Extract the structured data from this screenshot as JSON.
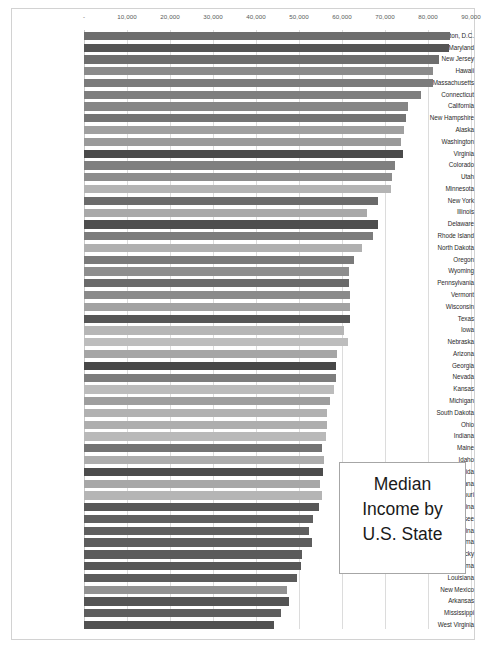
{
  "title_box": {
    "text": "Median\nIncome by\nU.S. State"
  },
  "chart_data": {
    "type": "bar",
    "orientation": "horizontal",
    "title": "Median Income by U.S. State",
    "xlabel": "",
    "ylabel": "",
    "xlim": [
      0,
      90000
    ],
    "grid": true,
    "legend": "none",
    "tick_labels": [
      "-",
      "10,000",
      "20,000",
      "30,000",
      "40,000",
      "50,000",
      "60,000",
      "70,000",
      "80,000",
      "90,000"
    ],
    "tick_values": [
      0,
      10000,
      20000,
      30000,
      40000,
      50000,
      60000,
      70000,
      80000,
      90000
    ],
    "categories": [
      "Washington, D.C.",
      "Maryland",
      "New Jersey",
      "Hawaii",
      "Massachusetts",
      "Connecticut",
      "California",
      "New Hampshire",
      "Alaska",
      "Washington",
      "Virginia",
      "Colorado",
      "Utah",
      "Minnesota",
      "New York",
      "Illinois",
      "Delaware",
      "Rhode Island",
      "North Dakota",
      "Oregon",
      "Wyoming",
      "Pennsylvania",
      "Vermont",
      "Wisconsin",
      "Texas",
      "Iowa",
      "Nebraska",
      "Arizona",
      "Georgia",
      "Nevada",
      "Kansas",
      "Michigan",
      "South Dakota",
      "Ohio",
      "Indiana",
      "Maine",
      "Idaho",
      "Florida",
      "Montana",
      "Missouri",
      "North Carolina",
      "Tennessee",
      "South Carolina",
      "Oklahoma",
      "Kentucky",
      "Alabama",
      "Louisiana",
      "New Mexico",
      "Arkansas",
      "Mississippi",
      "West Virginia"
    ],
    "values": [
      85203,
      84805,
      82545,
      81275,
      81215,
      78444,
      75235,
      74991,
      74346,
      73775,
      74222,
      72331,
      71621,
      71306,
      68486,
      65886,
      68287,
      67167,
      64577,
      62818,
      61584,
      61744,
      61973,
      61747,
      61874,
      60523,
      61439,
      58945,
      58700,
      58646,
      58218,
      57144,
      56521,
      56602,
      56303,
      55425,
      55785,
      55660,
      54970,
      55461,
      54602,
      53320,
      52306,
      52919,
      50589,
      50536,
      49469,
      47169,
      47597,
      45792,
      44097
    ],
    "bar_colors": [
      "#6d6d6d",
      "#555555",
      "#6e6e6e",
      "#8b8b8b",
      "#7b7b7b",
      "#7e7e7e",
      "#868686",
      "#747474",
      "#a0a0a0",
      "#9a9a9a",
      "#4a4a4a",
      "#7f7f7f",
      "#8d8d8d",
      "#b4b4b4",
      "#6b6b6b",
      "#a9a9a9",
      "#4e4e4e",
      "#7c7c7c",
      "#b0b0b0",
      "#7a7a7a",
      "#8e8e8e",
      "#6a6a6a",
      "#8a8a8a",
      "#a2a2a2",
      "#565656",
      "#b6b6b6",
      "#bdbdbd",
      "#a5a5a5",
      "#474747",
      "#7d7d7d",
      "#bcbcbc",
      "#9e9e9e",
      "#b1b1b1",
      "#aeaeae",
      "#b9b9b9",
      "#737373",
      "#adadad",
      "#4c4c4c",
      "#a7a7a7",
      "#b5b5b5",
      "#585858",
      "#606060",
      "#5f5f5f",
      "#5d5d5d",
      "#5b5b5b",
      "#575757",
      "#5c5c5c",
      "#929292",
      "#545454",
      "#5e5e5e",
      "#515151"
    ]
  }
}
